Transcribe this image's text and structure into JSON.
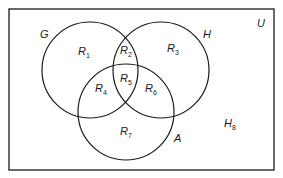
{
  "diagram": {
    "type": "venn",
    "universe_label": "U",
    "sets": [
      {
        "label": "G",
        "cx": 90,
        "cy": 70,
        "r": 48
      },
      {
        "label": "H",
        "cx": 160,
        "cy": 70,
        "r": 48
      },
      {
        "label": "A",
        "cx": 126,
        "cy": 114,
        "r": 48
      }
    ],
    "regions": [
      {
        "base": "R",
        "sub": "1"
      },
      {
        "base": "R",
        "sub": "2"
      },
      {
        "base": "R",
        "sub": "3"
      },
      {
        "base": "R",
        "sub": "4"
      },
      {
        "base": "R",
        "sub": "5"
      },
      {
        "base": "R",
        "sub": "6"
      },
      {
        "base": "R",
        "sub": "7"
      },
      {
        "base": "H",
        "sub": "8"
      }
    ],
    "colors": {
      "stroke": "#1a1a1a",
      "background": "#ffffff"
    }
  }
}
